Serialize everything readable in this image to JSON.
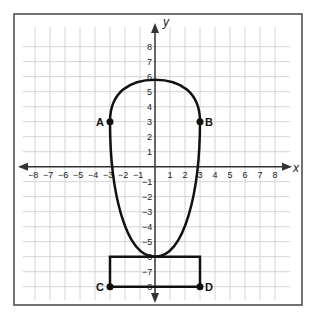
{
  "diagram": {
    "axes": {
      "x_label": "x",
      "y_label": "y",
      "x_range": [
        -8,
        8
      ],
      "y_range": [
        -8,
        8
      ],
      "x_ticks": [
        "−8",
        "−7",
        "−6",
        "−5",
        "−4",
        "−3",
        "−2",
        "−1",
        "1",
        "2",
        "3",
        "4",
        "5",
        "6",
        "7",
        "8"
      ],
      "y_ticks_pos": [
        "1",
        "2",
        "3",
        "4",
        "5",
        "6",
        "7",
        "8"
      ],
      "y_ticks_neg": [
        "−1",
        "−2",
        "−3",
        "−4",
        "−5",
        "−6",
        "−7",
        "−8"
      ]
    },
    "points": [
      {
        "label": "A",
        "x": -3,
        "y": 3
      },
      {
        "label": "B",
        "x": 3,
        "y": 3
      },
      {
        "label": "C",
        "x": -3,
        "y": -8
      },
      {
        "label": "D",
        "x": 3,
        "y": -8
      }
    ],
    "shapes": {
      "curve": "closed teardrop curve through A and B, top near y=5.8, bottom point at (0,-6)",
      "rectangle": {
        "corners": [
          [
            -3,
            -6
          ],
          [
            3,
            -6
          ],
          [
            3,
            -8
          ],
          [
            -3,
            -8
          ]
        ]
      }
    },
    "colors": {
      "grid": "#d4d4d4",
      "ink": "#111111",
      "border": "#444444"
    }
  }
}
